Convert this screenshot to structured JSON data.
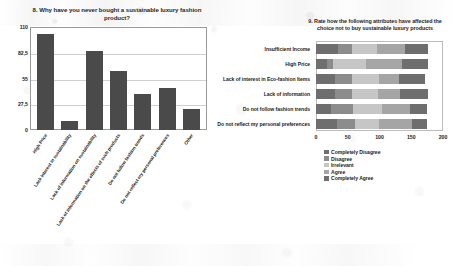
{
  "chart_data": [
    {
      "type": "bar",
      "id": "left",
      "title": "8. Why have you never bought a sustainable luxury fashion product?",
      "xlabel": "",
      "ylabel": "",
      "ylim": [
        0,
        110
      ],
      "yticks": [
        "110",
        "82,5",
        "55",
        "27,5",
        "0"
      ],
      "ytick_values": [
        110,
        82.5,
        55,
        27.5,
        0
      ],
      "grid": true,
      "legend": "none",
      "bar_color": "#4a4a4a",
      "categories": [
        "High Price",
        "Lack  interest in sustainability",
        "Lack of information on sustainability",
        "Lack of information on the effects of such products",
        "Do not follow fashion trends",
        "Do not reflect my personal preferences",
        "Other"
      ],
      "values": [
        103,
        10,
        84,
        63,
        38,
        45,
        22
      ]
    },
    {
      "type": "bar",
      "id": "right",
      "orientation": "horizontal",
      "stacked": true,
      "title": "9. Rate how the following attributes have affected the choice not to buy sustainable luxury products",
      "xlabel": "",
      "ylabel": "",
      "xlim": [
        0,
        200
      ],
      "xticks": [
        "0",
        "50",
        "100",
        "150",
        "200"
      ],
      "xtick_values": [
        0,
        50,
        100,
        150,
        200
      ],
      "grid": false,
      "legend_position": "bottom-left",
      "categories": [
        "Insufficient Income",
        "High Price",
        "Lack of interest in Eco-fashion Items",
        "Lack of information",
        "Do not follow fashion trends",
        "Do not reflect my personal preferences"
      ],
      "series": [
        {
          "name": "Completely Disagree",
          "color": "#6e6e6e",
          "values": [
            34,
            17,
            30,
            30,
            24,
            33
          ]
        },
        {
          "name": "Disagree",
          "color": "#8c8c8c",
          "values": [
            22,
            10,
            27,
            27,
            34,
            29
          ]
        },
        {
          "name": "Irrelevant",
          "color": "#c6c6c6",
          "values": [
            40,
            52,
            42,
            40,
            46,
            37
          ]
        },
        {
          "name": "Agree",
          "color": "#a5a5a5",
          "values": [
            44,
            56,
            31,
            36,
            44,
            52
          ]
        },
        {
          "name": "Completely Agree",
          "color": "#6e6e6e",
          "values": [
            36,
            41,
            42,
            44,
            27,
            24
          ]
        }
      ]
    }
  ]
}
